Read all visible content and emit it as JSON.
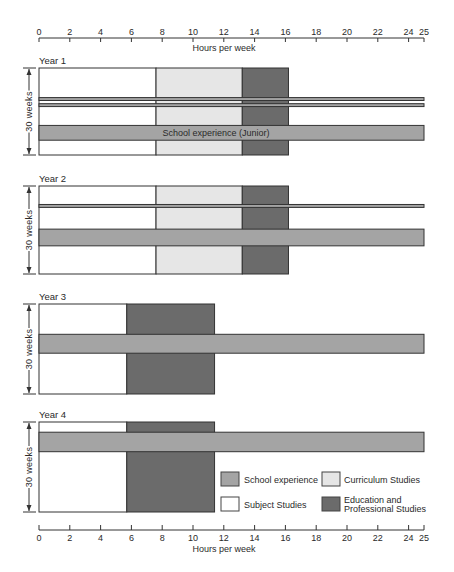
{
  "chart_data": {
    "type": "bar",
    "subtype": "timeline-block",
    "title": "",
    "xlabel": "Hours per week",
    "ylabel": "30 weeks",
    "xlim": [
      0,
      25
    ],
    "x_ticks": [
      0,
      2,
      4,
      6,
      8,
      10,
      12,
      14,
      16,
      18,
      20,
      22,
      24,
      25
    ],
    "x_axis_positions": [
      "top",
      "bottom"
    ],
    "grid": false,
    "weeks_total": 30,
    "colors": {
      "Subject Studies": "#ffffff",
      "Curriculum Studies": "#e6e6e6",
      "Education and Professional Studies": "#6b6b6b",
      "School experience": "#a4a4a4",
      "outline": "#333333"
    },
    "panels": [
      {
        "label": "Year 1",
        "columns": [
          {
            "category": "Subject Studies",
            "start": 0,
            "end": 7.6
          },
          {
            "category": "Curriculum Studies",
            "start": 7.6,
            "end": 13.2
          },
          {
            "category": "Education and Professional Studies",
            "start": 13.2,
            "end": 16.2
          }
        ],
        "school_experience": [
          {
            "start": 0,
            "end": 25,
            "week_start": 10.2,
            "week_end": 11.2,
            "label": ""
          },
          {
            "start": 0,
            "end": 25,
            "week_start": 12.3,
            "week_end": 13.3,
            "label": ""
          },
          {
            "start": 0,
            "end": 25,
            "week_start": 19.8,
            "week_end": 24.9,
            "label": "School experience (Junior)"
          }
        ]
      },
      {
        "label": "Year 2",
        "columns": [
          {
            "category": "Subject Studies",
            "start": 0,
            "end": 7.6
          },
          {
            "category": "Curriculum Studies",
            "start": 7.6,
            "end": 13.2
          },
          {
            "category": "Education and Professional Studies",
            "start": 13.2,
            "end": 16.2
          }
        ],
        "school_experience": [
          {
            "start": 0,
            "end": 25,
            "week_start": 6.3,
            "week_end": 7.3,
            "label": ""
          },
          {
            "start": 0,
            "end": 25,
            "week_start": 14.7,
            "week_end": 20.4,
            "label": ""
          }
        ]
      },
      {
        "label": "Year 3",
        "columns": [
          {
            "category": "Subject Studies",
            "start": 0,
            "end": 5.7
          },
          {
            "category": "Education and Professional Studies",
            "start": 5.7,
            "end": 11.4
          }
        ],
        "school_experience": [
          {
            "start": 0,
            "end": 25,
            "week_start": 10.1,
            "week_end": 16.4,
            "label": ""
          }
        ]
      },
      {
        "label": "Year 4",
        "columns": [
          {
            "category": "Subject Studies",
            "start": 0,
            "end": 5.7
          },
          {
            "category": "Education and Professional Studies",
            "start": 5.7,
            "end": 11.4
          }
        ],
        "school_experience": [
          {
            "start": 0,
            "end": 25,
            "week_start": 3.4,
            "week_end": 9.9,
            "label": ""
          }
        ]
      }
    ],
    "legend": {
      "position": "inside-bottom-right (Year 4 panel)",
      "entries": [
        {
          "label": "School experience",
          "lines": [
            "School experience"
          ],
          "color": "#a4a4a4"
        },
        {
          "label": "Curriculum Studies",
          "lines": [
            "Curriculum Studies"
          ],
          "color": "#e6e6e6"
        },
        {
          "label": "Subject Studies",
          "lines": [
            "Subject Studies"
          ],
          "color": "#ffffff"
        },
        {
          "label": "Education and Professional Studies",
          "lines": [
            "Education and",
            "Professional Studies"
          ],
          "color": "#6b6b6b"
        }
      ]
    }
  }
}
